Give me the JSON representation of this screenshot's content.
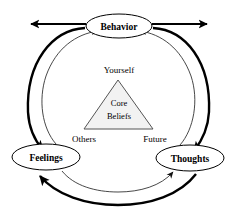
{
  "diagram": {
    "nodes": {
      "behavior": {
        "label": "Behavior"
      },
      "feelings": {
        "label": "Feelings"
      },
      "thoughts": {
        "label": "Thoughts"
      }
    },
    "triangle": {
      "center_line1": "Core",
      "center_line2": "Beliefs",
      "top_label": "Yourself",
      "bottom_left_label": "Others",
      "bottom_right_label": "Future"
    },
    "colors": {
      "stroke": "#000000",
      "thin_stroke": "#333333",
      "triangle_fill": "#f2f2f2",
      "triangle_stroke": "#555555",
      "node_fill": "#ffffff",
      "background": "#ffffff"
    },
    "connectors": [
      {
        "name": "behavior-to-feelings-outer",
        "style": "thick",
        "direction": "counterclockwise"
      },
      {
        "name": "feelings-to-behavior-inner",
        "style": "thin",
        "direction": "clockwise"
      },
      {
        "name": "behavior-to-thoughts-outer",
        "style": "thick",
        "direction": "clockwise"
      },
      {
        "name": "thoughts-to-behavior-inner",
        "style": "thin",
        "direction": "counterclockwise"
      },
      {
        "name": "thoughts-to-feelings-outer",
        "style": "thick",
        "direction": "counterclockwise"
      },
      {
        "name": "feelings-to-thoughts-inner",
        "style": "thin",
        "direction": "clockwise"
      },
      {
        "name": "behavior-external-left-arrow",
        "style": "thick",
        "direction": "outward-left"
      },
      {
        "name": "behavior-external-right-arrow",
        "style": "thick",
        "direction": "outward-right"
      }
    ]
  }
}
